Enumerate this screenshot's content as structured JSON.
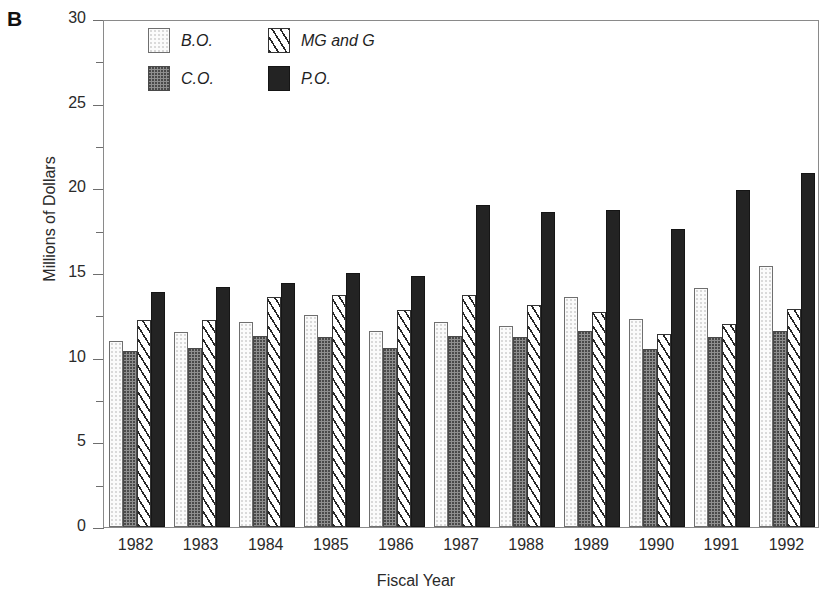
{
  "panel": {
    "label": "B"
  },
  "chart_data": {
    "type": "bar",
    "title": "",
    "xlabel": "Fiscal Year",
    "ylabel": "Millions of Dollars",
    "ylim": [
      0,
      30
    ],
    "ytick_major": [
      0,
      5,
      10,
      15,
      20,
      25,
      30
    ],
    "ytick_minor": [
      2.5,
      7.5,
      12.5,
      17.5,
      22.5,
      27.5
    ],
    "grid": false,
    "legend_position": "top-left-inside",
    "categories": [
      "1982",
      "1983",
      "1984",
      "1985",
      "1986",
      "1987",
      "1988",
      "1989",
      "1990",
      "1991",
      "1992"
    ],
    "series": [
      {
        "name": "B.O.",
        "pattern": "light-stipple",
        "color": "#fbfbfb",
        "values": [
          11.0,
          11.5,
          12.1,
          12.5,
          11.6,
          12.1,
          11.9,
          13.6,
          12.3,
          14.1,
          15.4
        ]
      },
      {
        "name": "C.O.",
        "pattern": "dark-stipple",
        "color": "#8f8f8f",
        "values": [
          10.4,
          10.6,
          11.3,
          11.2,
          10.6,
          11.3,
          11.2,
          11.6,
          10.5,
          11.2,
          11.6
        ]
      },
      {
        "name": "MG and G",
        "pattern": "diagonal-hatch",
        "color": "#ffffff",
        "values": [
          12.2,
          12.2,
          13.6,
          13.7,
          12.8,
          13.7,
          13.1,
          12.7,
          11.4,
          12.0,
          12.9
        ]
      },
      {
        "name": "P.O.",
        "pattern": "solid-black",
        "color": "#232323",
        "values": [
          13.9,
          14.2,
          14.4,
          15.0,
          14.8,
          19.0,
          18.6,
          18.7,
          17.6,
          19.9,
          20.9
        ]
      }
    ]
  }
}
